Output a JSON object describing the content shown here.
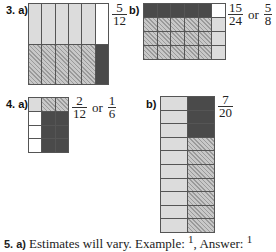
{
  "q3": {
    "label": "3.",
    "a": {
      "label": "a)",
      "grid": {
        "cols": 6,
        "rows": 2,
        "cells": [
          "light",
          "light",
          "light",
          "light",
          "light",
          "white",
          "hatch",
          "hatch",
          "hatch",
          "hatch",
          "hatch",
          "dark"
        ]
      },
      "answer": {
        "num": "5",
        "den": "12"
      }
    },
    "b": {
      "label": "b)",
      "grid": {
        "cols": 6,
        "rows": 4,
        "cells": [
          "dark",
          "dark",
          "dark",
          "dark",
          "dark",
          "white",
          "hatch",
          "hatch",
          "hatch",
          "hatch",
          "hatch",
          "light",
          "hatch",
          "hatch",
          "hatch",
          "hatch",
          "hatch",
          "light",
          "hatch",
          "hatch",
          "hatch",
          "hatch",
          "hatch",
          "light"
        ]
      },
      "answer": {
        "num": "15",
        "den": "24",
        "or": "or",
        "num2": "5",
        "den2": "8"
      }
    }
  },
  "q4": {
    "label": "4.",
    "a": {
      "label": "a)",
      "grid": {
        "cols": 3,
        "rows": 4,
        "cells": [
          "light",
          "hatch",
          "hatch",
          "white",
          "dark",
          "dark",
          "white",
          "dark",
          "dark",
          "white",
          "dark",
          "dark"
        ]
      },
      "answer": {
        "num": "2",
        "den": "12",
        "or": "or",
        "num2": "1",
        "den2": "6"
      }
    },
    "b": {
      "label": "b)",
      "grid": {
        "cols": 2,
        "rows": 10,
        "cells": [
          "light",
          "dark",
          "light",
          "dark",
          "light",
          "dark",
          "light",
          "hatch",
          "light",
          "hatch",
          "light",
          "hatch",
          "light",
          "hatch",
          "light",
          "hatch",
          "light",
          "hatch",
          "light",
          "hatch"
        ]
      },
      "answer": {
        "num": "7",
        "den": "20"
      }
    }
  },
  "q5": {
    "label": "5. a)",
    "text": "Estimates will vary. Example:",
    "example_value": "1",
    "answer_label": ", Answer:",
    "answer_value": "1"
  },
  "colors": {
    "dark": "#4a4a4a",
    "light": "#dcdcdc",
    "hatch": "#c8c8c8",
    "white": "#ffffff",
    "grid_line": "#555555"
  }
}
